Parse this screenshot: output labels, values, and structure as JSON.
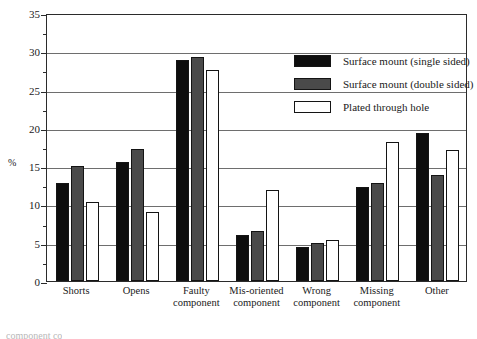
{
  "chart_data": {
    "type": "bar",
    "title": "",
    "xlabel": "",
    "ylabel": "%",
    "ylim": [
      0,
      35
    ],
    "ytick_step": 5,
    "yminor_step": 2.5,
    "grid": true,
    "legend_position": "top-right-inside",
    "categories": [
      "Shorts",
      "Opens",
      "Faulty component",
      "Mis-oriented component",
      "Wrong component",
      "Missing component",
      "Other"
    ],
    "category_lines": [
      [
        "Shorts"
      ],
      [
        "Opens"
      ],
      [
        "Faulty",
        "component"
      ],
      [
        "Mis-oriented",
        "component"
      ],
      [
        "Wrong",
        "component"
      ],
      [
        "Missing",
        "component"
      ],
      [
        "Other"
      ]
    ],
    "series": [
      {
        "name": "Surface mount (single sided)",
        "color": "#0d0d0d",
        "values": [
          12.8,
          15.5,
          28.9,
          6.0,
          4.4,
          12.3,
          19.3
        ]
      },
      {
        "name": "Surface mount (double sided)",
        "color": "#4a4a4a",
        "values": [
          15.0,
          17.2,
          29.2,
          6.5,
          5.0,
          12.8,
          13.9
        ]
      },
      {
        "name": "Plated through hole",
        "color": "#ffffff",
        "values": [
          10.3,
          9.0,
          27.6,
          11.9,
          5.3,
          18.2,
          17.1
        ]
      }
    ],
    "ytick_labels": [
      "0",
      "5",
      "10",
      "15",
      "20",
      "25",
      "30",
      "35"
    ]
  },
  "caption": "component        co"
}
